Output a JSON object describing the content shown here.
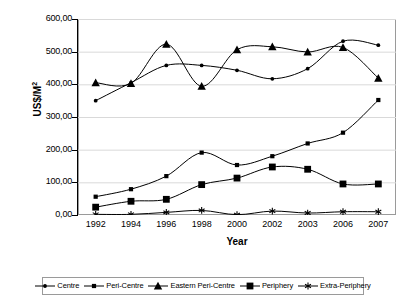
{
  "chart_data": {
    "type": "line",
    "title": "",
    "xlabel": "Year",
    "ylabel": "US$/M²",
    "categories": [
      "1992",
      "1994",
      "1996",
      "1998",
      "2000",
      "2002",
      "2003",
      "2006",
      "2007"
    ],
    "ylim": [
      0,
      600
    ],
    "ytick_labels": [
      "600,00",
      "500,00",
      "400,00",
      "300,00",
      "200,00",
      "100,00",
      "0,00"
    ],
    "ytick_values": [
      600,
      500,
      400,
      300,
      200,
      100,
      0
    ],
    "grid": "horizontal",
    "legend_position": "bottom",
    "series": [
      {
        "name": "Centre",
        "marker": "dot",
        "values": [
          350,
          405,
          458,
          458,
          443,
          417,
          448,
          532,
          520
        ]
      },
      {
        "name": "Peri-Centre",
        "marker": "small-square",
        "values": [
          56,
          79,
          119,
          191,
          153,
          180,
          219,
          252,
          352
        ]
      },
      {
        "name": "Eastern Peri-Centre",
        "marker": "triangle",
        "values": [
          405,
          403,
          523,
          394,
          506,
          515,
          499,
          513,
          419
        ]
      },
      {
        "name": "Periphery",
        "marker": "square",
        "values": [
          24,
          42,
          48,
          93,
          113,
          147,
          140,
          95,
          95
        ]
      },
      {
        "name": "Extra-Periphery",
        "marker": "asterisk",
        "values": [
          2,
          2,
          8,
          14,
          1,
          12,
          6,
          10,
          10
        ]
      }
    ],
    "colors": {
      "line": "#000000",
      "marker": "#000000",
      "grid": "#d9d9d9",
      "frame": "#9a9a9a",
      "axis": "#000000",
      "background": "#ffffff"
    }
  }
}
